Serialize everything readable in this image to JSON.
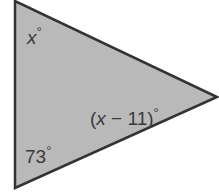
{
  "diagram": {
    "type": "triangle",
    "fill_color": "#b9b9b9",
    "stroke_color": "#333333",
    "vertices": {
      "top": [
        15,
        1
      ],
      "bottom": [
        15,
        188
      ],
      "right": [
        217,
        97
      ]
    },
    "angles": [
      {
        "vertex": "top",
        "label": "x°",
        "var": "x",
        "deg": "°"
      },
      {
        "vertex": "right",
        "label": "(x − 11)°",
        "prefix": "(",
        "var": "x",
        "rest": " − 11)",
        "deg": "°"
      },
      {
        "vertex": "bottom",
        "label": "73°",
        "value": "73",
        "deg": "°"
      }
    ]
  }
}
